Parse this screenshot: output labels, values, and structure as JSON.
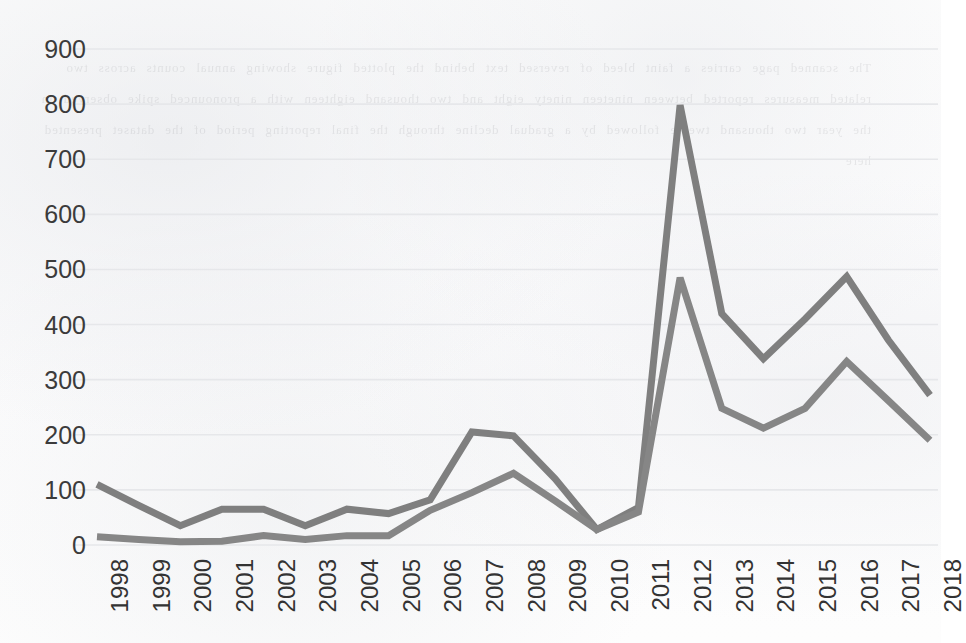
{
  "chart_data": {
    "type": "line",
    "title": "",
    "xlabel": "",
    "ylabel": "",
    "categories": [
      "1998",
      "1999",
      "2000",
      "2001",
      "2002",
      "2003",
      "2004",
      "2005",
      "2006",
      "2007",
      "2008",
      "2009",
      "2010",
      "2011",
      "2012",
      "2013",
      "2014",
      "2015",
      "2016",
      "2017",
      "2018"
    ],
    "ylim": [
      0,
      900
    ],
    "ytick_values": [
      0,
      100,
      200,
      300,
      400,
      500,
      600,
      700,
      800,
      900
    ],
    "ytick_labels": [
      "0",
      "100",
      "200",
      "300",
      "400",
      "500",
      "600",
      "700",
      "800",
      "900"
    ],
    "grid": true,
    "legend": "none",
    "xtick_rotation": 90,
    "series": [
      {
        "name": "series-1",
        "color": "#7F7F7F",
        "line_width": 7,
        "values": [
          110,
          72,
          35,
          65,
          65,
          35,
          65,
          57,
          82,
          205,
          198,
          120,
          28,
          68,
          798,
          420,
          338,
          410,
          487,
          372,
          272
        ]
      },
      {
        "name": "series-2",
        "color": "#868686",
        "line_width": 7,
        "values": [
          15,
          10,
          6,
          7,
          17,
          10,
          17,
          17,
          63,
          95,
          130,
          80,
          28,
          60,
          485,
          248,
          212,
          248,
          333,
          262,
          190
        ]
      }
    ]
  },
  "axes": {
    "plot_left": 97,
    "plot_right": 930,
    "y_zero_px": 545,
    "y_top_px": 49,
    "gridline_color": "#E6E7EA",
    "axis_text_color": "#333333"
  },
  "background": {
    "paper_color": "#FDFDFD",
    "ghost_text": "The scanned page carries a faint bleed of reversed text behind the plotted figure showing annual counts across two related measures reported between nineteen ninety eight and two thousand eighteen with a pronounced spike observed in the year two thousand twelve followed by a gradual decline through the final reporting period of the dataset presented here"
  }
}
